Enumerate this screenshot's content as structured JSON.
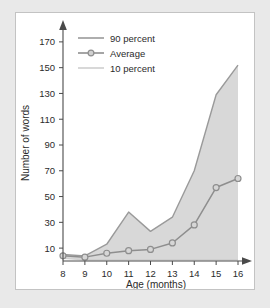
{
  "chart_data": {
    "type": "area",
    "title": "",
    "xlabel": "Age (months)",
    "ylabel": "Number of words",
    "x": [
      8,
      9,
      10,
      11,
      12,
      13,
      14,
      15,
      16
    ],
    "xlim": [
      8,
      16
    ],
    "ylim": [
      0,
      180
    ],
    "xticks": [
      "8",
      "9",
      "10",
      "11",
      "12",
      "13",
      "14",
      "15",
      "16"
    ],
    "yticks": [
      "10",
      "30",
      "50",
      "70",
      "90",
      "110",
      "130",
      "150",
      "170"
    ],
    "ytick_values": [
      10,
      30,
      50,
      70,
      90,
      110,
      130,
      150,
      170
    ],
    "grid": false,
    "legend_position": "top-left",
    "series": [
      {
        "name": "90 percent",
        "values": [
          5,
          4,
          13,
          38,
          23,
          34,
          70,
          129,
          152
        ],
        "color": "#9a9a9a",
        "marker": "none"
      },
      {
        "name": "Average",
        "values": [
          4,
          3,
          6,
          8,
          9,
          14,
          28,
          57,
          64
        ],
        "color": "#8e8e8e",
        "marker": "circle"
      },
      {
        "name": "10 percent",
        "values": [
          2,
          1,
          1,
          1,
          1,
          1,
          1,
          1,
          1
        ],
        "color": "#cfcfcf",
        "marker": "none"
      }
    ],
    "band": {
      "fill_color": "#d8d8d8",
      "upper_series": "90 percent",
      "lower_series": "10 percent"
    }
  },
  "legend": {
    "items": [
      {
        "label": "90 percent"
      },
      {
        "label": "Average"
      },
      {
        "label": "10 percent"
      }
    ]
  },
  "axes": {
    "x_title": "Age (months)",
    "y_title": "Number of words"
  },
  "colors": {
    "panel_background": "#ffffff",
    "outer_background": "#e9e9e9",
    "panel_border": "#c3c3c3",
    "axis": "#4a4a4a",
    "band_fill": "#d8d8d8",
    "upper_line": "#9a9a9a",
    "average_line": "#8e8e8e",
    "lower_line": "#cfcfcf",
    "text": "#2b2b2b"
  }
}
